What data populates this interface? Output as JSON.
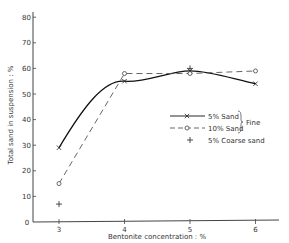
{
  "chart_data": {
    "type": "line",
    "title": "",
    "xlabel": "Bentonite concentration : %",
    "ylabel": "Total sand in suspension : %",
    "xlim": [
      2.6,
      6.3
    ],
    "ylim": [
      0,
      80
    ],
    "x_ticks": [
      3,
      4,
      5,
      6
    ],
    "y_ticks": [
      0,
      10,
      20,
      30,
      40,
      50,
      60,
      70,
      80
    ],
    "origin_label": "0",
    "grid": false,
    "legend_position": "right-middle",
    "legend_group_label": "Fine",
    "series": [
      {
        "name": "5% Sand",
        "marker": "x",
        "line": "solid-curve",
        "x": [
          3,
          4,
          5,
          6
        ],
        "values": [
          29,
          55,
          59,
          54
        ]
      },
      {
        "name": "10% Sand",
        "marker": "o",
        "line": "dashed",
        "x": [
          3,
          4,
          5,
          6
        ],
        "values": [
          15,
          58,
          58,
          59
        ]
      },
      {
        "name": "5% Coarse sand",
        "marker": "+",
        "line": "none",
        "x": [
          3,
          5
        ],
        "values": [
          7,
          60
        ]
      }
    ]
  }
}
